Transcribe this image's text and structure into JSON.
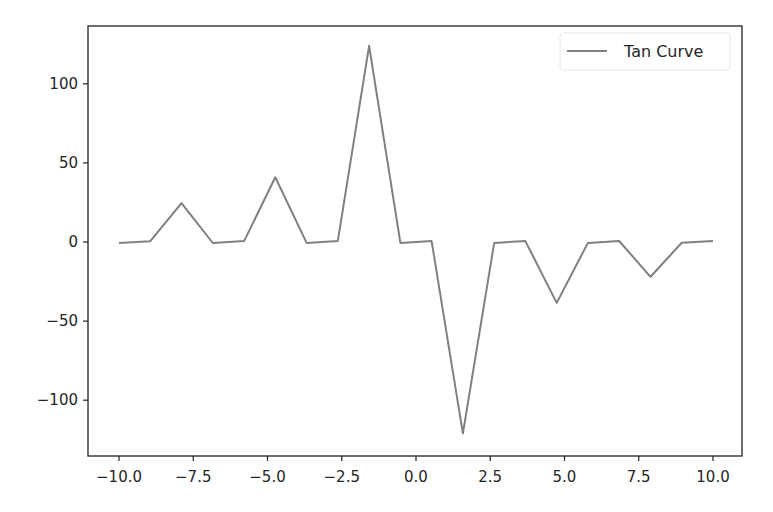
{
  "chart_data": {
    "type": "line",
    "title": "",
    "xlabel": "",
    "ylabel": "",
    "xlim": [
      -11.0,
      11.0
    ],
    "ylim": [
      -136,
      136
    ],
    "grid": false,
    "legend_position": "upper right",
    "x_ticks": [
      -10.0,
      -7.5,
      -5.0,
      -2.5,
      0.0,
      2.5,
      5.0,
      7.5,
      10.0
    ],
    "x_tick_labels": [
      "−10.0",
      "−7.5",
      "−5.0",
      "−2.5",
      "0.0",
      "2.5",
      "5.0",
      "7.5",
      "10.0"
    ],
    "y_ticks": [
      100,
      50,
      0,
      -50,
      -100
    ],
    "y_tick_labels": [
      "100",
      "50",
      "0",
      "−50",
      "−100"
    ],
    "series": [
      {
        "name": "Tan Curve",
        "color": "#808080",
        "x": [
          -10.0,
          -8.947,
          -7.895,
          -6.842,
          -5.789,
          -4.737,
          -3.684,
          -2.632,
          -1.579,
          -0.526,
          0.526,
          1.579,
          2.632,
          3.684,
          4.737,
          5.789,
          6.842,
          7.895,
          8.947,
          10.0
        ],
        "values": [
          -0.65,
          0.52,
          24.6,
          -0.63,
          0.54,
          40.9,
          -0.6,
          0.56,
          124.0,
          -0.58,
          0.58,
          -121.0,
          -0.56,
          0.6,
          -38.5,
          -0.54,
          0.63,
          -22.0,
          -0.52,
          0.65
        ]
      }
    ]
  },
  "legend": {
    "items": [
      {
        "label": "Tan Curve",
        "color": "#808080"
      }
    ]
  }
}
